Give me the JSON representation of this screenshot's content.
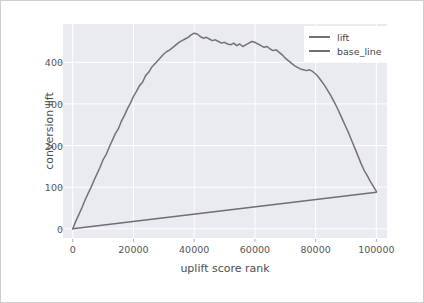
{
  "chart_data": {
    "type": "line",
    "title": "",
    "xlabel": "uplift score rank",
    "ylabel": "conversion lift",
    "xlim": [
      -3200,
      103500
    ],
    "ylim": [
      -22,
      492
    ],
    "grid": true,
    "legend_position": "upper right",
    "xticks": [
      0,
      20000,
      40000,
      60000,
      80000,
      100000
    ],
    "xtick_labels": [
      "0",
      "20000",
      "40000",
      "60000",
      "80000",
      "100000"
    ],
    "yticks": [
      0,
      100,
      200,
      300,
      400
    ],
    "ytick_labels": [
      "0",
      "100",
      "200",
      "300",
      "400"
    ],
    "colors": {
      "lift": "#737373",
      "base_line": "#6f6f6f",
      "plot_background": "#eaeaf1",
      "grid": "#ffffff",
      "figure_background": "#ffffff",
      "figure_border": "#cfcfcf",
      "tick_text": "#555555",
      "axis_title_text": "#4d4d4d"
    },
    "series": [
      {
        "name": "lift",
        "x": [
          0,
          1000,
          2000,
          3000,
          4000,
          5000,
          6000,
          7000,
          8000,
          9000,
          10000,
          11000,
          12000,
          13000,
          14000,
          15000,
          16000,
          17000,
          18000,
          19000,
          20000,
          21000,
          22000,
          23000,
          24000,
          25000,
          26000,
          27000,
          28000,
          29000,
          30000,
          31000,
          32000,
          33000,
          34000,
          35000,
          36000,
          37000,
          38000,
          39000,
          40000,
          41000,
          42000,
          43000,
          44000,
          45000,
          46000,
          47000,
          48000,
          49000,
          50000,
          51000,
          52000,
          53000,
          54000,
          55000,
          56000,
          57000,
          58000,
          59000,
          60000,
          61000,
          62000,
          63000,
          64000,
          65000,
          66000,
          67000,
          68000,
          69000,
          70000,
          71000,
          72000,
          73000,
          74000,
          75000,
          76000,
          77000,
          78000,
          79000,
          80000,
          81000,
          82000,
          83000,
          84000,
          85000,
          86000,
          87000,
          88000,
          89000,
          90000,
          91000,
          92000,
          93000,
          94000,
          95000,
          96000,
          97000,
          98000,
          99000,
          100000
        ],
        "y": [
          0,
          18,
          34,
          50,
          68,
          84,
          99,
          116,
          132,
          148,
          166,
          178,
          196,
          212,
          228,
          240,
          258,
          272,
          288,
          302,
          318,
          330,
          344,
          352,
          368,
          376,
          388,
          396,
          404,
          412,
          420,
          426,
          430,
          436,
          442,
          448,
          452,
          456,
          460,
          466,
          470,
          468,
          462,
          458,
          460,
          456,
          452,
          454,
          450,
          446,
          448,
          444,
          442,
          446,
          440,
          444,
          438,
          442,
          446,
          450,
          448,
          444,
          440,
          436,
          438,
          432,
          428,
          430,
          424,
          418,
          410,
          404,
          398,
          392,
          388,
          384,
          382,
          380,
          382,
          378,
          372,
          364,
          354,
          344,
          332,
          320,
          306,
          292,
          276,
          260,
          244,
          228,
          210,
          192,
          174,
          156,
          140,
          128,
          114,
          102,
          90
        ]
      },
      {
        "name": "base_line",
        "x": [
          0,
          100000
        ],
        "y": [
          0,
          88
        ]
      }
    ]
  },
  "legend": {
    "items": [
      {
        "label": "lift",
        "color": "#737373"
      },
      {
        "label": "base_line",
        "color": "#6f6f6f"
      }
    ]
  }
}
